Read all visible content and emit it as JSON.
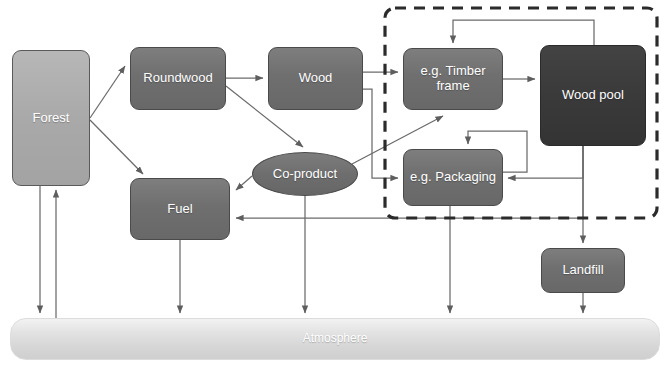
{
  "diagram": {
    "title_fragment": "",
    "nodes": {
      "forest": "Forest",
      "roundwood": "Roundwood",
      "wood": "Wood",
      "coproduct": "Co-product",
      "fuel": "Fuel",
      "timber_frame": "e.g. Timber frame",
      "wood_pool": "Wood pool",
      "packaging": "e.g. Packaging",
      "landfill": "Landfill",
      "atmosphere": "Atmosphere"
    },
    "colors": {
      "light_node": "#a9a9a9",
      "mid_node": "#6f6f6f",
      "dark_node": "#3a3a3a",
      "atmosphere_bar": "#dcdcdc",
      "line": "#6b6b6b",
      "dashed_group_border": "#2b2b2b"
    },
    "group": {
      "name": "products-in-use-group",
      "style": "dashed"
    },
    "edges": [
      {
        "from": "Forest",
        "to": "Roundwood"
      },
      {
        "from": "Forest",
        "to": "Fuel"
      },
      {
        "from": "Forest",
        "to": "Atmosphere"
      },
      {
        "from": "Atmosphere",
        "to": "Forest"
      },
      {
        "from": "Roundwood",
        "to": "Wood"
      },
      {
        "from": "Roundwood",
        "to": "Co-product"
      },
      {
        "from": "Wood",
        "to": "e.g. Timber frame"
      },
      {
        "from": "Wood",
        "to": "e.g. Packaging"
      },
      {
        "from": "Co-product",
        "to": "Fuel"
      },
      {
        "from": "Co-product",
        "to": "e.g. Timber frame"
      },
      {
        "from": "Co-product",
        "to": "Atmosphere"
      },
      {
        "from": "Fuel",
        "to": "Atmosphere"
      },
      {
        "from": "e.g. Timber frame",
        "to": "Wood pool"
      },
      {
        "from": "Wood pool",
        "to": "e.g. Timber frame"
      },
      {
        "from": "Wood pool",
        "to": "e.g. Packaging"
      },
      {
        "from": "Wood pool",
        "to": "Landfill"
      },
      {
        "from": "Wood pool",
        "to": "Fuel"
      },
      {
        "from": "e.g. Packaging",
        "to": "e.g. Packaging"
      },
      {
        "from": "e.g. Packaging",
        "to": "Atmosphere"
      },
      {
        "from": "Landfill",
        "to": "Atmosphere"
      }
    ]
  }
}
